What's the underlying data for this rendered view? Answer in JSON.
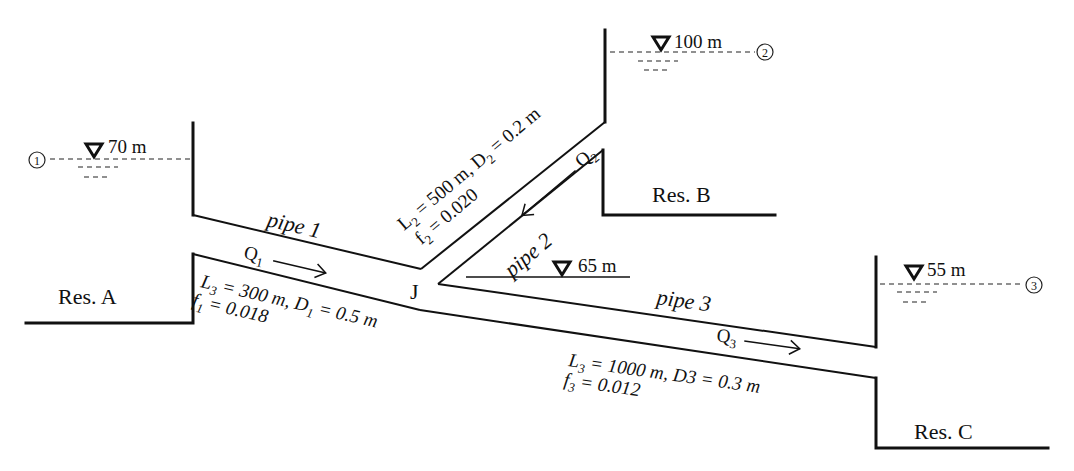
{
  "reservoirs": {
    "A": {
      "name": "Res. A",
      "elevation": "70 m",
      "point": "1"
    },
    "B": {
      "name": "Res. B",
      "elevation": "100 m",
      "point": "2"
    },
    "C": {
      "name": "Res. C",
      "elevation": "55 m",
      "point": "3"
    }
  },
  "junction": {
    "name": "J",
    "elevation": "65 m"
  },
  "pipes": {
    "p1": {
      "label": "pipe 1",
      "flow": "Q",
      "flow_sub": "1",
      "line1_a": "L",
      "line1_a_sub": "3",
      "line1_b": " = 300 m, D",
      "line1_b_sub": "1",
      "line1_c": " = 0.5 m",
      "line2_a": "f",
      "line2_a_sub": "1",
      "line2_b": " = 0.018"
    },
    "p2": {
      "label": "pipe 2",
      "flow": "Q",
      "flow_sub": "2",
      "line1_a": "L",
      "line1_a_sub": "2",
      "line1_b": " = 500 m, D",
      "line1_b_sub": "2",
      "line1_c": " = 0.2 m",
      "line2_a": "f",
      "line2_a_sub": "2",
      "line2_b": " = 0.020"
    },
    "p3": {
      "label": "pipe 3",
      "flow": "Q",
      "flow_sub": "3",
      "line1_a": "L",
      "line1_a_sub": "3",
      "line1_b": " = 1000 m, D3 = 0.3 m",
      "line2_a": "f",
      "line2_a_sub": "3",
      "line2_b": " = 0.012"
    }
  },
  "colors": {
    "ink": "#111111",
    "background": "#ffffff"
  }
}
